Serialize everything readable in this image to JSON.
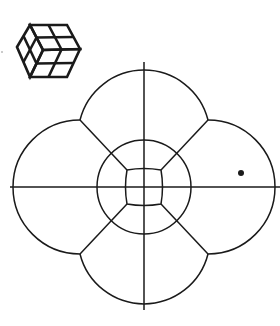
{
  "figure": {
    "width": 280,
    "height": 326,
    "background": "#ffffff",
    "stroke_color": "#1a1a1a",
    "cube_icon": {
      "hexagon": [
        [
          30,
          25
        ],
        [
          67,
          25
        ],
        [
          80,
          49
        ],
        [
          67,
          77
        ],
        [
          30,
          77
        ],
        [
          17,
          47
        ]
      ],
      "front_vertex": [
        43,
        50
      ]
    },
    "flower": {
      "center": [
        144,
        187
      ],
      "axis_h": {
        "x1": 10,
        "x2": 280
      },
      "axis_v": {
        "y1": 62,
        "y2": 310
      },
      "inner_square": {
        "half": 17,
        "bulge": 3
      },
      "middle_circle_radius": 47,
      "petal_center_offset": 50,
      "petal_radius": 66,
      "junction_offset": [
        64,
        67
      ]
    },
    "dot": {
      "cx": 241,
      "cy": 173,
      "r": 3
    },
    "speck": {
      "cx": 2,
      "cy": 52,
      "r": 0.8
    }
  }
}
